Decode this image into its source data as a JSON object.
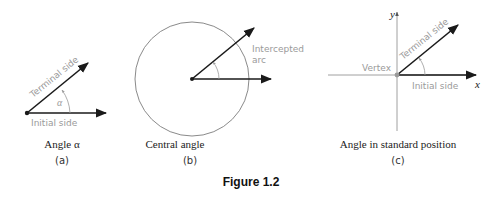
{
  "figure": {
    "title": "Figure 1.2",
    "panels": [
      {
        "id": "a",
        "caption": "Angle α",
        "sublabel": "(a)",
        "labels": {
          "terminal": "Terminal side",
          "initial": "Initial side",
          "angle": "α"
        }
      },
      {
        "id": "b",
        "caption": "Central angle",
        "sublabel": "(b)",
        "labels": {
          "arc_line1": "Intercepted",
          "arc_line2": "arc"
        }
      },
      {
        "id": "c",
        "caption": "Angle in standard position",
        "sublabel": "(c)",
        "labels": {
          "terminal": "Terminal side",
          "initial": "Initial side",
          "vertex": "Vertex",
          "x_axis": "x",
          "y_axis": "y"
        }
      }
    ]
  },
  "colors": {
    "line": "#1a1a1a",
    "label_gray": "#9a9a9a",
    "circle": "#8a8a8a",
    "axis": "#888888"
  }
}
